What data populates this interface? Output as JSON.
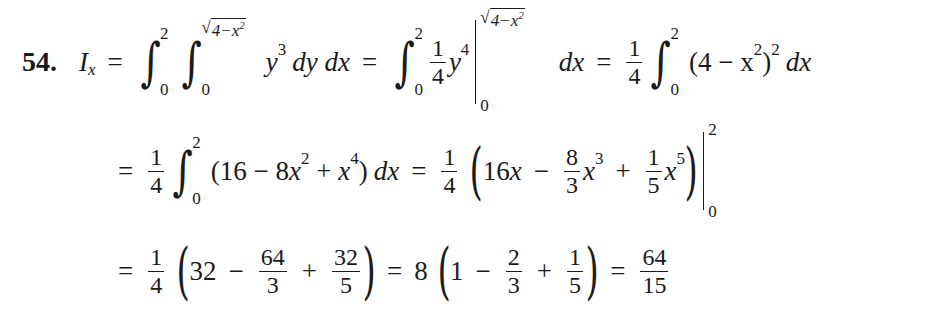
{
  "problem": {
    "number": "54.",
    "lhs_symbol": "I",
    "lhs_subscript": "x"
  },
  "line1": {
    "int1": {
      "lower": "0",
      "upper": "2"
    },
    "int2": {
      "lower": "0",
      "upper_sqrt": "4−x",
      "upper_sqrt_exp": "2"
    },
    "integrand_var": "y",
    "integrand_exp": "3",
    "differentials": "dy dx",
    "step2": {
      "int": {
        "lower": "0",
        "upper": "2"
      },
      "coef": {
        "num": "1",
        "den": "4"
      },
      "var": "y",
      "exp": "4",
      "eval_upper_sqrt": "4−x",
      "eval_upper_exp": "2",
      "eval_lower": "0",
      "differential": "dx"
    },
    "step3": {
      "coef": {
        "num": "1",
        "den": "4"
      },
      "int": {
        "lower": "0",
        "upper": "2"
      },
      "base": "(4 − x",
      "inner_exp": "2",
      "close": ")",
      "outer_exp": "2",
      "differential": "dx"
    }
  },
  "line2": {
    "coef": {
      "num": "1",
      "den": "4"
    },
    "int": {
      "lower": "0",
      "upper": "2"
    },
    "poly": {
      "open": "(16 − 8",
      "x1": "x",
      "e1": "2",
      "plus": " + ",
      "x2": "x",
      "e2": "4",
      "close": ")"
    },
    "differential": "dx",
    "result": {
      "coef": {
        "num": "1",
        "den": "4"
      },
      "t1": "16",
      "t1var": "x",
      "minus": "−",
      "f2": {
        "num": "8",
        "den": "3"
      },
      "t2var": "x",
      "t2exp": "3",
      "plus": "+",
      "f3": {
        "num": "1",
        "den": "5"
      },
      "t3var": "x",
      "t3exp": "5",
      "eval_upper": "2",
      "eval_lower": "0"
    }
  },
  "line3": {
    "coef": {
      "num": "1",
      "den": "4"
    },
    "a": "32",
    "minus1": "−",
    "f1": {
      "num": "64",
      "den": "3"
    },
    "plus1": "+",
    "f2": {
      "num": "32",
      "den": "5"
    },
    "mult": "8",
    "b": "1",
    "minus2": "−",
    "f3": {
      "num": "2",
      "den": "3"
    },
    "plus2": "+",
    "f4": {
      "num": "1",
      "den": "5"
    },
    "answer": {
      "num": "64",
      "den": "15"
    }
  },
  "symbols": {
    "equals": "=",
    "integral": "∫",
    "sqrt": "√",
    "lparen": "(",
    "rparen": ")"
  }
}
